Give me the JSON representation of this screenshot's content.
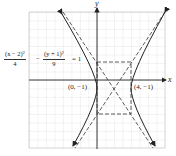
{
  "diagram": {
    "type": "hyperbola-graph",
    "equation": {
      "term1_num": "(x − 2)²",
      "term1_den": "4",
      "minus": "−",
      "term2_num": "(y + 1)²",
      "term2_den": "9",
      "equals": "= 1"
    },
    "axes": {
      "x_label": "x",
      "y_label": "y"
    },
    "vertices": [
      {
        "label": "(0, −1)",
        "x": 0,
        "y": -1
      },
      {
        "label": "(4, −1)",
        "x": 4,
        "y": -1
      }
    ],
    "center": {
      "x": 2,
      "y": -1
    },
    "a": 2,
    "b": 3,
    "colors": {
      "curve": "#222222",
      "grid": "#b8b8b8",
      "axis": "#222222"
    }
  }
}
